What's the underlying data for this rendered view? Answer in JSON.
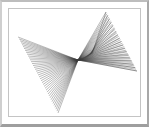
{
  "window": {
    "title": "String Art Envelope Figure",
    "background_color": "#ffffff",
    "frame_color": "#bdbdbd",
    "frame_shadow_color": "#9e9e9e",
    "panel_color": "#ffffff",
    "panel_border_color": "#c4c4c4"
  },
  "figure": {
    "name": "line-envelope-string-art",
    "line_color": "#3a3a3a",
    "line_width": 0.35,
    "viewbox": "0 0 137 114",
    "cusp_point": {
      "x": 72,
      "y": 54
    },
    "tips": {
      "left": {
        "x": 12,
        "y": 31
      },
      "bottom": {
        "x": 52,
        "y": 107
      },
      "top_right": {
        "x": 100,
        "y": 6
      },
      "right": {
        "x": 131,
        "y": 65
      }
    },
    "pencils": [
      {
        "name": "left-bottom-fan",
        "from": {
          "x1": 12,
          "y1": 31,
          "x2": 72,
          "y2": 54
        },
        "to": {
          "x1": 52,
          "y1": 107,
          "x2": 72,
          "y2": 54
        },
        "steps": 40
      },
      {
        "name": "top-right-fan",
        "from": {
          "x1": 100,
          "y1": 6,
          "x2": 72,
          "y2": 54
        },
        "to": {
          "x1": 131,
          "y1": 65,
          "x2": 72,
          "y2": 54
        },
        "steps": 34
      },
      {
        "name": "right-sweep-fan",
        "from": {
          "x1": 131,
          "y1": 65,
          "x2": 72,
          "y2": 54
        },
        "to": {
          "x1": 100,
          "y1": 6,
          "x2": 86,
          "y2": 48
        },
        "steps": 18
      }
    ],
    "line_counts": {
      "left_bottom": 40,
      "top_right": 34,
      "right_sweep": 18,
      "total": 92
    }
  }
}
